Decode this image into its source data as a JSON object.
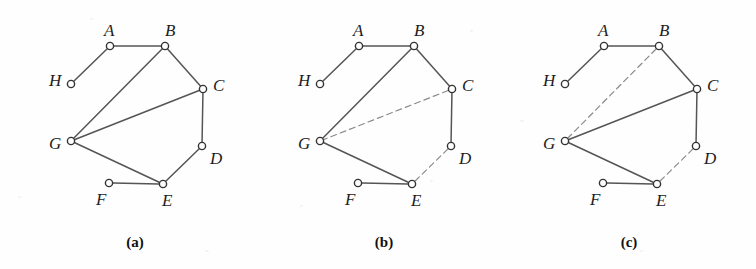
{
  "figure": {
    "width": 756,
    "height": 269,
    "background_color": "#fefefe",
    "edge_color": "#555555",
    "dashed_edge_color": "#8a8a8a",
    "node_stroke_color": "#333333",
    "node_fill_color": "#ffffff",
    "label_color": "#1d1d1d",
    "node_radius": 3.6,
    "edge_width": 1.5,
    "dash_pattern": "6,4"
  },
  "vertices": {
    "A": {
      "x": 110,
      "y": 46,
      "label": "A",
      "label_dx": -6,
      "label_dy": -24,
      "label_anchor": "above-left"
    },
    "B": {
      "x": 165,
      "y": 46,
      "label": "B",
      "label_dx": 0,
      "label_dy": -24,
      "label_anchor": "above"
    },
    "C": {
      "x": 203,
      "y": 89,
      "label": "C",
      "label_dx": 10,
      "label_dy": -12,
      "label_anchor": "right"
    },
    "D": {
      "x": 202,
      "y": 146,
      "label": "D",
      "label_dx": 8,
      "label_dy": 4,
      "label_anchor": "right-below"
    },
    "E": {
      "x": 163,
      "y": 184,
      "label": "E",
      "label_dx": -1,
      "label_dy": 8,
      "label_anchor": "below"
    },
    "F": {
      "x": 109,
      "y": 183,
      "label": "F",
      "label_dx": -13,
      "label_dy": 8,
      "label_anchor": "below-left"
    },
    "G": {
      "x": 71,
      "y": 141,
      "label": "G",
      "label_dx": -22,
      "label_dy": -6,
      "label_anchor": "left"
    },
    "H": {
      "x": 71,
      "y": 84,
      "label": "H",
      "label_dx": -22,
      "label_dy": -12,
      "label_anchor": "left"
    }
  },
  "panels": [
    {
      "id": "a",
      "caption": "(a)",
      "caption_x": 105,
      "caption_y": 234,
      "offset_x": 0,
      "edges": [
        {
          "from": "A",
          "to": "B",
          "style": "solid"
        },
        {
          "from": "A",
          "to": "H",
          "style": "solid"
        },
        {
          "from": "B",
          "to": "C",
          "style": "solid"
        },
        {
          "from": "B",
          "to": "G",
          "style": "solid"
        },
        {
          "from": "C",
          "to": "D",
          "style": "solid"
        },
        {
          "from": "C",
          "to": "G",
          "style": "solid"
        },
        {
          "from": "D",
          "to": "E",
          "style": "solid"
        },
        {
          "from": "E",
          "to": "F",
          "style": "solid"
        },
        {
          "from": "E",
          "to": "G",
          "style": "solid"
        }
      ]
    },
    {
      "id": "b",
      "caption": "(b)",
      "caption_x": 105,
      "caption_y": 234,
      "offset_x": 249,
      "edges": [
        {
          "from": "A",
          "to": "B",
          "style": "solid"
        },
        {
          "from": "A",
          "to": "H",
          "style": "solid"
        },
        {
          "from": "B",
          "to": "C",
          "style": "solid"
        },
        {
          "from": "B",
          "to": "G",
          "style": "solid"
        },
        {
          "from": "C",
          "to": "D",
          "style": "solid"
        },
        {
          "from": "C",
          "to": "G",
          "style": "dashed"
        },
        {
          "from": "D",
          "to": "E",
          "style": "dashed"
        },
        {
          "from": "E",
          "to": "F",
          "style": "solid"
        },
        {
          "from": "E",
          "to": "G",
          "style": "solid"
        }
      ]
    },
    {
      "id": "c",
      "caption": "(c)",
      "caption_x": 105,
      "caption_y": 234,
      "offset_x": 494,
      "edges": [
        {
          "from": "A",
          "to": "B",
          "style": "solid"
        },
        {
          "from": "A",
          "to": "H",
          "style": "solid"
        },
        {
          "from": "B",
          "to": "C",
          "style": "solid"
        },
        {
          "from": "B",
          "to": "G",
          "style": "dashed"
        },
        {
          "from": "C",
          "to": "D",
          "style": "solid"
        },
        {
          "from": "C",
          "to": "G",
          "style": "solid"
        },
        {
          "from": "D",
          "to": "E",
          "style": "dashed"
        },
        {
          "from": "E",
          "to": "F",
          "style": "solid"
        },
        {
          "from": "E",
          "to": "G",
          "style": "solid"
        }
      ]
    }
  ],
  "chart_data": {
    "type": "diagram",
    "title": "",
    "vertex_names": [
      "A",
      "B",
      "C",
      "D",
      "E",
      "F",
      "G",
      "H"
    ],
    "base_edges": [
      "A-B",
      "A-H",
      "B-C",
      "B-G",
      "C-D",
      "C-G",
      "D-E",
      "E-F",
      "E-G"
    ],
    "panel_a_dashed": [],
    "panel_b_dashed": [
      "C-G",
      "D-E"
    ],
    "panel_c_dashed": [
      "B-G",
      "D-E"
    ],
    "captions": [
      "(a)",
      "(b)",
      "(c)"
    ]
  }
}
